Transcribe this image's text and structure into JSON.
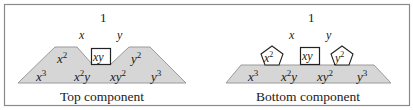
{
  "colors": {
    "border": "#8a8a8a",
    "fill": "#d6d6d6",
    "shape_stroke": "#9a9a9a",
    "box_stroke": "#222222",
    "text": "#1a1a1a"
  },
  "panels": [
    {
      "caption": "Top component",
      "top": "1",
      "deg1": {
        "x": "x",
        "y": "y"
      },
      "deg2": {
        "x2": "x",
        "x2_exp": "2",
        "xy": "xy",
        "y2": "y",
        "y2_exp": "2"
      },
      "deg3": {
        "x3": "x",
        "x3_exp": "3",
        "x2y_base": "x",
        "x2y_exp": "2",
        "x2y_tail": "y",
        "xy2_base": "xy",
        "xy2_exp": "2",
        "y3": "y",
        "y3_exp": "3"
      },
      "boxed": [
        "xy"
      ],
      "pentagons": []
    },
    {
      "caption": "Bottom component",
      "top": "1",
      "deg1": {
        "x": "x",
        "y": "y"
      },
      "deg2": {
        "x2": "x",
        "x2_exp": "2",
        "xy": "xy",
        "y2": "y",
        "y2_exp": "2"
      },
      "deg3": {
        "x3": "x",
        "x3_exp": "3",
        "x2y_base": "x",
        "x2y_exp": "2",
        "x2y_tail": "y",
        "xy2_base": "xy",
        "xy2_exp": "2",
        "y3": "y",
        "y3_exp": "3"
      },
      "boxed": [
        "xy"
      ],
      "pentagons": [
        "x^2",
        "y^2"
      ]
    }
  ]
}
